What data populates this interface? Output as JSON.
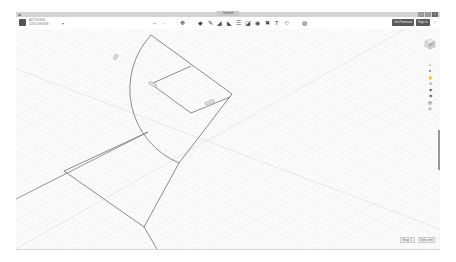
{
  "window": {
    "title": "Untitled",
    "sys_icon": "app-menu-icon",
    "controls": [
      "minimize",
      "maximize",
      "close"
    ]
  },
  "app": {
    "brand_line1": "AUTODESK",
    "brand_line2": "123D DESIGN",
    "menu_caret": "▾"
  },
  "toolbar": {
    "tools": [
      {
        "name": "undo",
        "glyph": "←"
      },
      {
        "name": "redo",
        "glyph": "→"
      },
      {
        "name": "transform",
        "glyph": "✥"
      },
      {
        "name": "primitives",
        "glyph": "◆"
      },
      {
        "name": "sketch",
        "glyph": "✎"
      },
      {
        "name": "construct",
        "glyph": "◢"
      },
      {
        "name": "modify",
        "glyph": "◣"
      },
      {
        "name": "pattern",
        "glyph": "☰"
      },
      {
        "name": "grouping",
        "glyph": "◪"
      },
      {
        "name": "combine",
        "glyph": "◉"
      },
      {
        "name": "measure",
        "glyph": "✖"
      },
      {
        "name": "text",
        "glyph": "T"
      },
      {
        "name": "snap",
        "glyph": "⟲"
      },
      {
        "name": "material",
        "glyph": "◍"
      }
    ],
    "go_premium_label": "Go Premium",
    "sign_in_label": "Sign In",
    "help_label": "?"
  },
  "side_toolbar": {
    "viewcube": "view-cube",
    "items": [
      {
        "name": "home-view",
        "glyph": "⌂"
      },
      {
        "name": "orbit",
        "glyph": "●"
      },
      {
        "name": "pan",
        "glyph": "✋"
      },
      {
        "name": "zoom",
        "glyph": "✕"
      },
      {
        "name": "fit",
        "glyph": "◆"
      },
      {
        "name": "visibility",
        "glyph": "◉"
      },
      {
        "name": "perspective",
        "glyph": "▤"
      },
      {
        "name": "material-view",
        "glyph": "◘"
      }
    ]
  },
  "sketch": {
    "dimension_labels": [
      "0.0",
      "0.0",
      "0.0"
    ]
  },
  "status": {
    "snap_label": "Snap: 1",
    "units_label": "Units: mm"
  }
}
